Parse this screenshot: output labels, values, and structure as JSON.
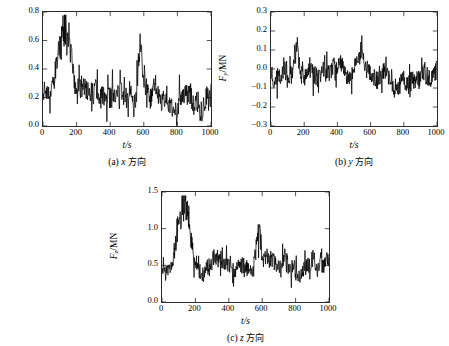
{
  "figure": {
    "background": "#ffffff",
    "line_color": "#000000",
    "axis_color": "#2a2a2a"
  },
  "chart_data": [
    {
      "type": "line",
      "panel_id": "a",
      "title": "",
      "caption": "(a) x 方向",
      "caption_prefix": "(a)",
      "caption_symbol": "x",
      "caption_cjk": "方向",
      "xlabel": "t/s",
      "ylabel": "F_x /MN",
      "ylabel_main": "F",
      "ylabel_sub": "x",
      "ylabel_unit": "/MN",
      "xlim": [
        0,
        1000
      ],
      "ylim": [
        0,
        0.8
      ],
      "xticks": [
        0,
        200,
        400,
        600,
        800,
        1000
      ],
      "xticklabels": [
        "0",
        "200",
        "400",
        "600",
        "800",
        "1000"
      ],
      "yticks": [
        0.0,
        0.2,
        0.4,
        0.6,
        0.8
      ],
      "yticklabels": [
        "0.0",
        "0.2",
        "0.4",
        "0.6",
        "0.8"
      ],
      "grid": false,
      "legend": null,
      "series_name": "Fx",
      "seed": 11,
      "baseline": 0.235,
      "noise": 0.075,
      "peak_center": 128,
      "peak_height": 0.5,
      "peak_width": 46,
      "peak2_center": 578,
      "peak2_height": 0.33,
      "peak2_width": 16,
      "y_min_clip": -0.01,
      "y_max_clip": 0.78,
      "approx_values": {
        "mean": 0.24,
        "max": 0.73,
        "min": 0.01
      }
    },
    {
      "type": "line",
      "panel_id": "b",
      "title": "",
      "caption": "(b) y 方向",
      "caption_prefix": "(b)",
      "caption_symbol": "y",
      "caption_cjk": "方向",
      "xlabel": "t/s",
      "ylabel": "F_y /MN",
      "ylabel_main": "F",
      "ylabel_sub": "y",
      "ylabel_unit": "/MN",
      "xlim": [
        0,
        1000
      ],
      "ylim": [
        -0.3,
        0.3
      ],
      "xticks": [
        0,
        200,
        400,
        600,
        800,
        1000
      ],
      "xticklabels": [
        "0",
        "200",
        "400",
        "600",
        "800",
        "1000"
      ],
      "yticks": [
        -0.3,
        -0.2,
        -0.1,
        0.0,
        0.1,
        0.2,
        0.3
      ],
      "yticklabels": [
        "−0.3",
        "−0.2",
        "−0.1",
        "0.0",
        "0.1",
        "0.2",
        "0.3"
      ],
      "grid": false,
      "legend": null,
      "series_name": "Fy",
      "seed": 27,
      "baseline": 0.005,
      "noise": 0.05,
      "peak_center": 155,
      "peak_height": 0.16,
      "peak_width": 22,
      "peak2_center": 548,
      "peak2_height": 0.1,
      "peak2_width": 12,
      "drift_start": 600,
      "drift_amount": -0.075,
      "y_min_clip": -0.28,
      "y_max_clip": 0.27,
      "approx_values": {
        "mean": -0.01,
        "max": 0.21,
        "min": -0.24
      }
    },
    {
      "type": "line",
      "panel_id": "c",
      "title": "",
      "caption": "(c) z 方向",
      "caption_prefix": "(c)",
      "caption_symbol": "z",
      "caption_cjk": "方向",
      "xlabel": "t/s",
      "ylabel": "F_z /MN",
      "ylabel_main": "F",
      "ylabel_sub": "z",
      "ylabel_unit": "/MN",
      "xlim": [
        0,
        1000
      ],
      "ylim": [
        0,
        1.5
      ],
      "xticks": [
        0,
        200,
        400,
        600,
        800,
        1000
      ],
      "xticklabels": [
        "0",
        "200",
        "400",
        "600",
        "800",
        "1000"
      ],
      "yticks": [
        0.0,
        0.5,
        1.0,
        1.5
      ],
      "yticklabels": [
        "0.0",
        "0.5",
        "1.0",
        "1.5"
      ],
      "grid": false,
      "legend": null,
      "series_name": "Fz",
      "seed": 43,
      "baseline": 0.47,
      "noise": 0.115,
      "peak_center": 131,
      "peak_height": 0.8,
      "peak_width": 44,
      "peak2_center": 578,
      "peak2_height": 0.45,
      "peak2_width": 18,
      "y_min_clip": 0.02,
      "y_max_clip": 1.45,
      "approx_values": {
        "mean": 0.48,
        "max": 1.32,
        "min": 0.03
      }
    }
  ]
}
